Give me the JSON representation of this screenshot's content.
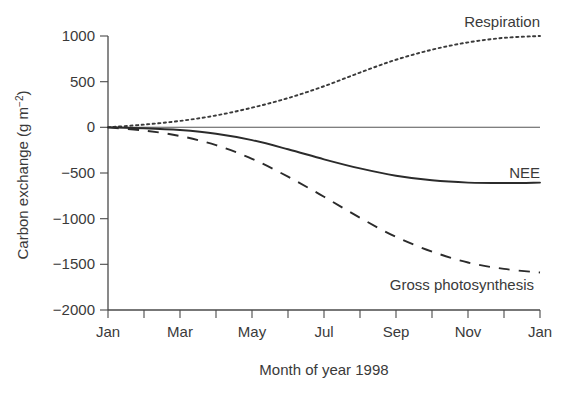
{
  "figure": {
    "background_color": "#ffffff",
    "ink_color": "#2b2b2b",
    "text_color": "#3a3a3a"
  },
  "axes": {
    "y_title_main": "Carbon exchange (g m",
    "y_title_sup": "−2",
    "y_title_close": ")",
    "y_title_full": "Carbon exchange (g m−2)",
    "x_title": "Month of year 1998",
    "y_ticks": [
      "1000",
      "500",
      "0",
      "−500",
      "−1000",
      "−1500",
      "−2000"
    ],
    "x_ticks_labeled": [
      "Jan",
      "Mar",
      "May",
      "Jul",
      "Sep",
      "Nov",
      "Jan"
    ]
  },
  "series_labels": {
    "respiration": "Respiration",
    "nee": "NEE",
    "gross_photosynthesis": "Gross photosynthesis"
  },
  "chart_data": {
    "type": "line",
    "title": "",
    "xlabel": "Month of year 1998",
    "ylabel": "Carbon exchange (g m−2)",
    "ylim": [
      -2000,
      1000
    ],
    "ytick_values": [
      1000,
      500,
      0,
      -500,
      -1000,
      -1500,
      -2000
    ],
    "xlim": [
      0,
      12
    ],
    "xtick_values": [
      0,
      1,
      2,
      3,
      4,
      5,
      6,
      7,
      8,
      9,
      10,
      11,
      12
    ],
    "xtick_labels": [
      "Jan",
      "",
      "Mar",
      "",
      "May",
      "",
      "Jul",
      "",
      "Sep",
      "",
      "Nov",
      "",
      "Jan"
    ],
    "grid": false,
    "legend": "inline-annotations",
    "x": [
      0,
      1,
      2,
      3,
      4,
      5,
      6,
      7,
      8,
      9,
      10,
      11,
      12
    ],
    "series": [
      {
        "name": "Respiration",
        "style": "dotted",
        "values": [
          0,
          30,
          70,
          130,
          215,
          320,
          450,
          600,
          740,
          850,
          930,
          980,
          1000
        ]
      },
      {
        "name": "NEE",
        "style": "solid",
        "values": [
          0,
          -10,
          -30,
          -70,
          -140,
          -240,
          -350,
          -450,
          -530,
          -580,
          -605,
          -610,
          -605
        ]
      },
      {
        "name": "Gross photosynthesis",
        "style": "dashed",
        "values": [
          0,
          -35,
          -95,
          -195,
          -345,
          -540,
          -760,
          -990,
          -1200,
          -1360,
          -1480,
          -1550,
          -1590
        ]
      }
    ]
  }
}
